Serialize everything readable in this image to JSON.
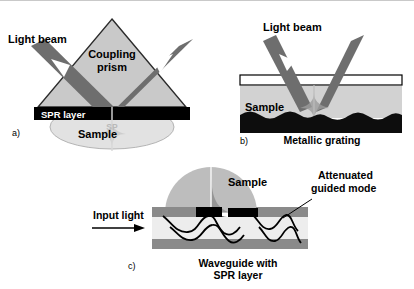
{
  "figure": {
    "background_color": "#ffffff",
    "border_color": "#c9c9c9"
  },
  "palette": {
    "prism_fill": "#c9c9c9",
    "prism_stroke": "#2b2b2b",
    "beam_fill": "#6e6e6e",
    "beam_arrowhead": "#ffffff",
    "spr_layer": "#000000",
    "sample_fill": "#e2e2e2",
    "sample_stroke": "#b4b4b4",
    "sample_dome": "#bdbdbd",
    "grating_black": "#0d0d0d",
    "cover_glass": "#ffffff",
    "waveguide_clad": "#8a8a8a",
    "waveguide_core": "#ededed",
    "mode_line": "#000000",
    "text": "#000000",
    "faint_text": "#b9b9b9"
  },
  "panels": [
    {
      "id": "a",
      "tag": "a)",
      "name": "prism-coupling-panel",
      "labels": {
        "light_beam": "Light beam",
        "coupling_prism_line1": "Coupling",
        "coupling_prism_line2": "prism",
        "spr_layer": "SPR layer",
        "sample": "Sample",
        "surface_plasmon": "SP"
      }
    },
    {
      "id": "b",
      "tag": "b)",
      "name": "grating-coupling-panel",
      "labels": {
        "light_beam": "Light beam",
        "sample": "Sample",
        "metallic_grating": "Metallic grating"
      }
    },
    {
      "id": "c",
      "tag": "c)",
      "name": "waveguide-coupling-panel",
      "labels": {
        "input_light": "Input light",
        "sample": "Sample",
        "attenuated_line1": "Attenuated",
        "attenuated_line2": "guided mode",
        "waveguide_line1": "Waveguide with",
        "waveguide_line2": "SPR layer"
      }
    }
  ]
}
